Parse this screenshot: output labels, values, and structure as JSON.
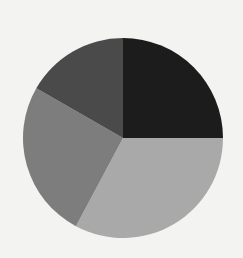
{
  "chart_data": {
    "type": "pie",
    "title": "",
    "labels_visible": false,
    "start_angle_deg": 0,
    "direction": "clockwise",
    "center": [
      123,
      138
    ],
    "radius": 100,
    "slices": [
      {
        "name": "slice-1",
        "value": 25.0,
        "color": "#1c1c1c"
      },
      {
        "name": "slice-2",
        "value": 32.8,
        "color": "#a9a9a9"
      },
      {
        "name": "slice-3",
        "value": 25.5,
        "color": "#7d7d7d"
      },
      {
        "name": "slice-4",
        "value": 16.7,
        "color": "#4a4a4a"
      }
    ],
    "values": [
      25.0,
      32.8,
      25.5,
      16.7
    ],
    "legend": "none"
  }
}
